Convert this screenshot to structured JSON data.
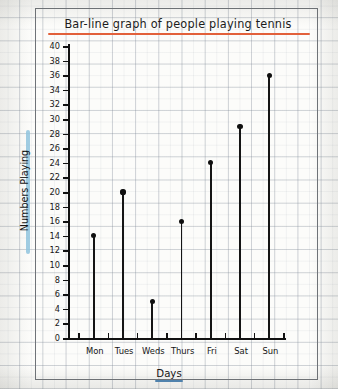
{
  "chart_data": {
    "type": "bar",
    "title": "Bar-line graph of people playing tennis",
    "xlabel": "Days",
    "ylabel": "Numbers Playing",
    "categories": [
      "Mon",
      "Tues",
      "Weds",
      "Thurs",
      "Fri",
      "Sat",
      "Sun"
    ],
    "values": [
      14,
      20,
      5,
      16,
      24,
      29,
      36
    ],
    "ylim": [
      0,
      40
    ],
    "ytick_step": 2,
    "yticks": [
      0,
      2,
      4,
      6,
      8,
      10,
      12,
      14,
      16,
      18,
      20,
      22,
      24,
      26,
      28,
      30,
      32,
      34,
      36,
      38,
      40
    ],
    "ytick_labels": [
      "0",
      "2",
      "4",
      "6",
      "8",
      "10",
      "12",
      "14",
      "16",
      "18",
      "20",
      "22",
      "24",
      "26",
      "28",
      "30",
      "32",
      "34",
      "36",
      "38",
      "40"
    ],
    "grid": "graph-paper background",
    "legend": "none",
    "style": "hand-drawn pencil on graph paper; vertical stems with solid round markers"
  },
  "annotations": {
    "title_underline_color": "#e2603a",
    "ylabel_highlight_color": "#8fc4de",
    "xlabel_underline_color": "#4f86b5",
    "axis_color": "#111111",
    "marker_color": "#101010",
    "paper_color": "#fcfcfa",
    "grid_color": "#78828f"
  }
}
